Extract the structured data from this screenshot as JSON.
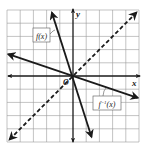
{
  "chart_data": {
    "type": "line",
    "title": "",
    "xlabel": "x",
    "ylabel": "y",
    "origin_label": "O",
    "xlim": [
      -5,
      5
    ],
    "ylim": [
      -5,
      5
    ],
    "grid": true,
    "grid_step": 1,
    "series": [
      {
        "name": "f(x)",
        "label": "f(x)",
        "equation": "y = -3x",
        "style": "solid",
        "points": [
          [
            -1.6,
            4.8
          ],
          [
            0,
            0
          ],
          [
            1.4,
            -4.6
          ]
        ],
        "label_position": [
          -3,
          3.5
        ]
      },
      {
        "name": "f^-1(x)",
        "label": "f⁻¹(x)",
        "equation": "y = -x/3",
        "style": "solid",
        "points": [
          [
            -4.9,
            1.65
          ],
          [
            0,
            0
          ],
          [
            4.9,
            -1.65
          ]
        ],
        "label_position": [
          2.6,
          -2.2
        ]
      },
      {
        "name": "y = x",
        "label": "",
        "equation": "y = x",
        "style": "dashed",
        "points": [
          [
            -4.8,
            -4.8
          ],
          [
            0,
            0
          ],
          [
            4.8,
            4.8
          ]
        ]
      }
    ]
  },
  "labels": {
    "x_axis": "x",
    "y_axis": "y",
    "origin": "O",
    "f": "f(x)",
    "f_inverse_base": "f",
    "f_inverse_sup": "−1",
    "f_inverse_arg": "(x)"
  },
  "colors": {
    "grid": "#9a9a9a",
    "axes": "#1a1a1a",
    "lines": "#1a1a1a",
    "background": "#ffffff"
  }
}
